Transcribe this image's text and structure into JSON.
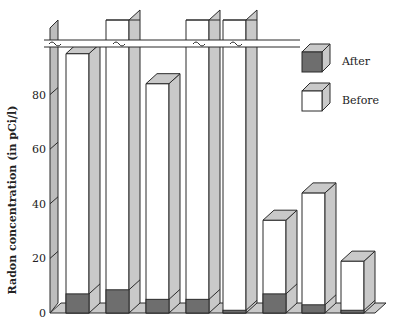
{
  "chart_data": {
    "type": "bar",
    "subtype": "3d-stacked-overlay",
    "title": "",
    "xlabel": "",
    "ylabel": "Radon concentration (in pCi/l)",
    "ylim": [
      0,
      100
    ],
    "yticks": [
      0,
      20,
      40,
      60,
      80
    ],
    "axis_break": true,
    "grid": false,
    "legend_position": "top-right",
    "categories": [
      "1",
      "2",
      "3",
      "4",
      "5",
      "6",
      "7",
      "8"
    ],
    "series": [
      {
        "name": "Before",
        "values": [
          95,
          null,
          84,
          null,
          null,
          34,
          44,
          19
        ],
        "off_scale": [
          false,
          true,
          false,
          true,
          true,
          false,
          false,
          false
        ]
      },
      {
        "name": "After",
        "values": [
          7,
          8.5,
          5,
          5,
          1,
          7,
          3,
          1
        ]
      }
    ],
    "legend": [
      {
        "label": "After",
        "swatch": "dark"
      },
      {
        "label": "Before",
        "swatch": "light"
      }
    ],
    "colors": {
      "after_front": "#6e6e6e",
      "before_front": "#ffffff",
      "side": "#c9c9c9",
      "top": "#c9c9c9",
      "edge": "#2a2a2a"
    }
  },
  "axis": {
    "label": "Radon concentration (in pCi/l)",
    "ticks": [
      "0",
      "20",
      "40",
      "60",
      "80"
    ]
  },
  "legend": {
    "after_label": "After",
    "before_label": "Before"
  }
}
